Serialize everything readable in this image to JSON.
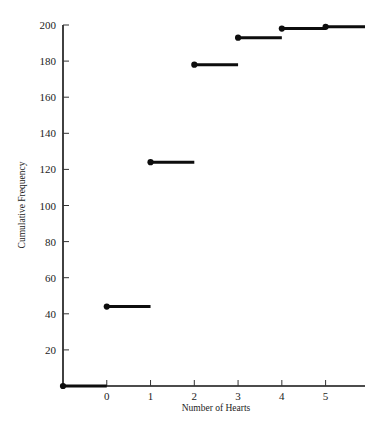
{
  "chart_data": {
    "type": "line",
    "subtype": "step-cumulative-frequency",
    "title": "",
    "xlabel": "Number of Hearts",
    "ylabel": "Cumulative Frequency",
    "xlim": [
      -1,
      5.9
    ],
    "ylim": [
      0,
      200
    ],
    "grid": false,
    "legend": null,
    "x_ticks": [
      0,
      1,
      2,
      3,
      4,
      5
    ],
    "x_tick_labels": [
      "0",
      "1",
      "2",
      "3",
      "4",
      "5"
    ],
    "y_ticks": [
      20,
      40,
      60,
      80,
      100,
      120,
      140,
      160,
      180,
      200
    ],
    "y_tick_labels": [
      "20",
      "40",
      "60",
      "80",
      "100",
      "120",
      "140",
      "160",
      "180",
      "200"
    ],
    "categories": [
      0,
      1,
      2,
      3,
      4,
      5
    ],
    "values": [
      44,
      124,
      178,
      193,
      198,
      199
    ],
    "steps": [
      {
        "x_start": -1.0,
        "x_end": 0.0,
        "y": 0,
        "dot_at_start": true
      },
      {
        "x_start": 0.0,
        "x_end": 1.0,
        "y": 44,
        "dot_at_start": true
      },
      {
        "x_start": 1.0,
        "x_end": 2.0,
        "y": 124,
        "dot_at_start": true
      },
      {
        "x_start": 2.0,
        "x_end": 3.0,
        "y": 178,
        "dot_at_start": true
      },
      {
        "x_start": 3.0,
        "x_end": 4.0,
        "y": 193,
        "dot_at_start": true
      },
      {
        "x_start": 4.0,
        "x_end": 5.0,
        "y": 198,
        "dot_at_start": true
      },
      {
        "x_start": 5.0,
        "x_end": 5.9,
        "y": 199,
        "dot_at_start": true
      }
    ]
  },
  "axes": {
    "y_title": "Cumulative Frequency",
    "x_title": "Number of Hearts"
  }
}
